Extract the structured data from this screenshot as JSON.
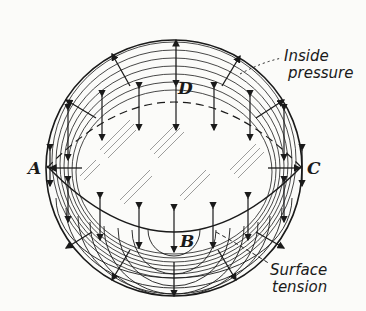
{
  "figure": {
    "type": "diagram",
    "points": {
      "A": "A",
      "B": "B",
      "C": "C",
      "D": "D"
    },
    "annotations": {
      "inside_pressure_line1": "Inside",
      "inside_pressure_line2": "pressure",
      "surface_tension_line1": "Surface",
      "surface_tension_line2": "tension"
    },
    "colors": {
      "ink": "#1a1a1a",
      "paper": "#fbfbf9"
    }
  }
}
